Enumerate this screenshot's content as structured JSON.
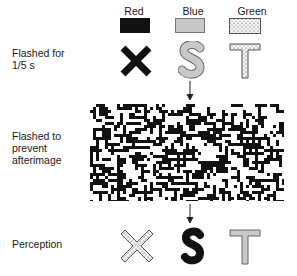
{
  "columns": [
    {
      "label": "Red",
      "swatch": "solid-black",
      "fill": "#111111"
    },
    {
      "label": "Blue",
      "swatch": "light-gray",
      "fill": "#c8c8c8"
    },
    {
      "label": "Green",
      "swatch": "stippled",
      "fill": "#f4f4f4"
    }
  ],
  "rows": {
    "flashed": {
      "label_line1": "Flashed for",
      "label_line2": "1/5 s",
      "letters": [
        "X",
        "S",
        "T"
      ]
    },
    "mask": {
      "label_line1": "Flashed to",
      "label_line2": "prevent",
      "label_line3": "afterimage"
    },
    "perception": {
      "label": "Perception",
      "letters": [
        "X",
        "S",
        "T"
      ]
    }
  },
  "colors": {
    "black": "#111111",
    "gray": "#c8c8c8",
    "stipple_bg": "#f4f4f4",
    "outline": "#555555"
  }
}
